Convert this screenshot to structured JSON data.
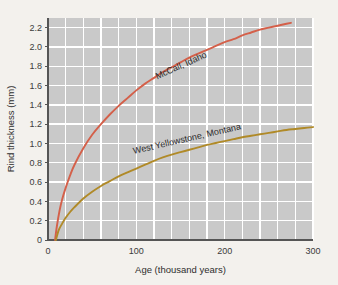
{
  "chart_data": {
    "type": "line",
    "title": "",
    "xlabel": "Age (thousand years)",
    "ylabel": "Rind thickness (mm)",
    "xlim": [
      0,
      300
    ],
    "ylim": [
      0,
      2.3
    ],
    "grid": true,
    "grid_x_step": 20,
    "grid_y_step": 0.2,
    "legend_position": "inline-curve-labels",
    "xticks": [
      0,
      100,
      200,
      300
    ],
    "xtick_labels": [
      "0",
      "100",
      "200",
      "300"
    ],
    "yticks": [
      0,
      0.2,
      0.4,
      0.6,
      0.8,
      1.0,
      1.2,
      1.4,
      1.6,
      1.8,
      2.0,
      2.2
    ],
    "ytick_labels": [
      "0",
      "0.2",
      "0.4",
      "0.6",
      "0.8",
      "1.0",
      "1.2",
      "1.4",
      "1.6",
      "1.8",
      "2.0",
      "2.2"
    ],
    "background_color": "#c9c9c9",
    "page_color": "#f3f1ed",
    "gridline_color": "#ffffff",
    "series": [
      {
        "name": "McCall, Idaho",
        "color": "#d4604a",
        "label_x": 152,
        "label_y": 1.78,
        "label_rotation": -24,
        "x": [
          8,
          10,
          13,
          16,
          20,
          25,
          30,
          40,
          50,
          60,
          70,
          80,
          90,
          100,
          110,
          120,
          130,
          140,
          150,
          160,
          170,
          180,
          190,
          200,
          210,
          220,
          230,
          240,
          250,
          260,
          270,
          275
        ],
        "values": [
          0.0,
          0.14,
          0.3,
          0.42,
          0.54,
          0.67,
          0.78,
          0.95,
          1.09,
          1.2,
          1.3,
          1.39,
          1.47,
          1.55,
          1.62,
          1.68,
          1.74,
          1.79,
          1.84,
          1.89,
          1.93,
          1.97,
          2.01,
          2.05,
          2.08,
          2.12,
          2.15,
          2.18,
          2.2,
          2.22,
          2.24,
          2.25
        ]
      },
      {
        "name": "West Yellowstone, Montana",
        "color": "#b08a28",
        "label_x": 158,
        "label_y": 1.02,
        "label_rotation": -13,
        "x": [
          9,
          12,
          16,
          20,
          25,
          30,
          40,
          50,
          60,
          70,
          80,
          90,
          100,
          110,
          120,
          130,
          140,
          150,
          160,
          170,
          180,
          190,
          200,
          210,
          220,
          230,
          240,
          250,
          260,
          270,
          280,
          290,
          300
        ],
        "values": [
          0.0,
          0.1,
          0.17,
          0.23,
          0.29,
          0.34,
          0.43,
          0.5,
          0.56,
          0.61,
          0.66,
          0.7,
          0.74,
          0.78,
          0.82,
          0.855,
          0.885,
          0.91,
          0.935,
          0.96,
          0.985,
          1.005,
          1.025,
          1.045,
          1.065,
          1.08,
          1.095,
          1.11,
          1.125,
          1.14,
          1.15,
          1.16,
          1.17
        ]
      }
    ]
  },
  "axis": {
    "x_title": "Age (thousand years)",
    "y_title": "Rind thickness (mm)"
  }
}
